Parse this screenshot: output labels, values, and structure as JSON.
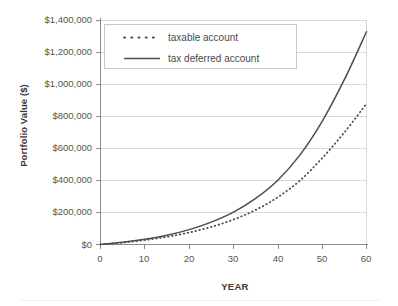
{
  "chart_data": {
    "type": "line",
    "title": "",
    "xlabel": "YEAR",
    "ylabel": "Portfolio Value ($)",
    "xlim": [
      0,
      60
    ],
    "ylim": [
      0,
      1400000
    ],
    "grid": "horizontal",
    "legend_position": "upper-left-inside",
    "x_ticks": [
      0,
      10,
      20,
      30,
      40,
      50,
      60
    ],
    "x_tick_labels": [
      "0",
      "10",
      "20",
      "30",
      "40",
      "50",
      "60"
    ],
    "y_ticks": [
      0,
      200000,
      400000,
      600000,
      800000,
      1000000,
      1200000,
      1400000
    ],
    "y_tick_labels": [
      "$0",
      "$200,000",
      "$400,000",
      "$600,000",
      "$800,000",
      "$1,000,000",
      "$1,200,000",
      "$1,400,000"
    ],
    "x": [
      0,
      5,
      10,
      15,
      20,
      25,
      30,
      35,
      40,
      45,
      50,
      55,
      60
    ],
    "series": [
      {
        "name": "taxable account",
        "style": "dotted",
        "color": "#4d4d4d",
        "values": [
          0,
          12000,
          28000,
          48000,
          75000,
          110000,
          156000,
          216000,
          296000,
          400000,
          540000,
          700000,
          880000
        ]
      },
      {
        "name": "tax deferred account",
        "style": "solid",
        "color": "#4d4d4d",
        "values": [
          0,
          14000,
          33000,
          58000,
          93000,
          140000,
          202000,
          288000,
          402000,
          560000,
          770000,
          1030000,
          1330000
        ]
      }
    ]
  },
  "legend": {
    "items": [
      {
        "label": "taxable account",
        "style": "dotted"
      },
      {
        "label": "tax deferred account",
        "style": "solid"
      }
    ]
  },
  "colors": {
    "gridline": "#d9d9d9",
    "axis": "#808080",
    "series": "#4d4d4d",
    "text": "#555555",
    "background": "#ffffff"
  }
}
